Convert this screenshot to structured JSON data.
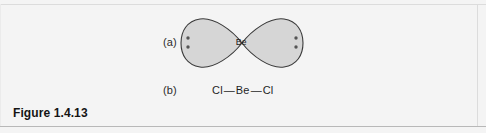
{
  "figure": {
    "caption": "Figure 1.4.13",
    "panel_background": "#f4f4f4",
    "border_color": "#c9c9c9"
  },
  "rows": [
    {
      "label": "(a)",
      "kind": "orbital-diagram",
      "description": "hybrid orbital bow-tie (two lobes) for BeCl2",
      "center_atom": "Be",
      "lobe_fill": "#d6d6d6",
      "lobe_stroke": "#3a3a3a",
      "lone_pair_dot_color": "#555555",
      "left_lobe_dots": 2,
      "right_lobe_dots": 2
    },
    {
      "label": "(b)",
      "kind": "lewis-formula",
      "atoms": [
        "Cl",
        "Be",
        "Cl"
      ],
      "bond_glyph": "—",
      "formula_text": "Cl — Be — Cl"
    }
  ],
  "formula": {
    "left_atom": "Cl",
    "left_bond": "—",
    "center_atom": "Be",
    "right_bond": "—",
    "right_atom": "Cl"
  }
}
